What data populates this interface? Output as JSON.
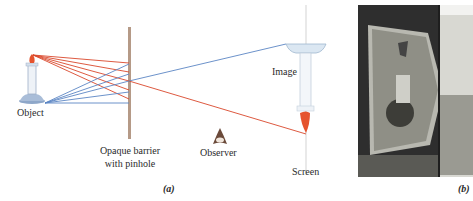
{
  "figure_a": {
    "labels": {
      "object": "Object",
      "barrier_line1": "Opaque barrier",
      "barrier_line2": "with pinhole",
      "image": "Image",
      "observer": "Observer",
      "screen": "Screen"
    },
    "caption": "(a)",
    "colors": {
      "red_rays": "#d9472b",
      "blue_rays": "#5b86c4",
      "barrier": "#b59a87",
      "screen_line": "#dcdcdc",
      "flame": "#e5532e"
    }
  },
  "figure_b": {
    "caption": "(b)",
    "description": "engraving of camera obscura"
  }
}
